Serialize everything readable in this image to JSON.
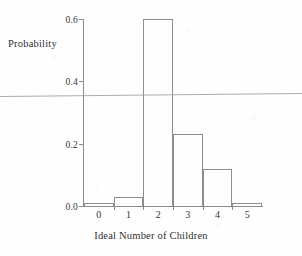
{
  "chart_data": {
    "type": "bar",
    "title": "",
    "xlabel": "Ideal Number of Children",
    "ylabel": "Probability",
    "categories": [
      "0",
      "1",
      "2",
      "3",
      "4",
      "5"
    ],
    "values": [
      0.01,
      0.03,
      0.6,
      0.23,
      0.12,
      0.01
    ],
    "ylim": [
      0.0,
      0.6
    ],
    "yticks": [
      "0.0",
      "0.2",
      "0.4",
      "0.6"
    ],
    "ytick_values": [
      0.0,
      0.2,
      0.4,
      0.6
    ],
    "xticks": [
      "0",
      "1",
      "2",
      "3",
      "4",
      "5"
    ],
    "grid": false,
    "legend": null,
    "series": [
      {
        "name": "Probability",
        "values": [
          0.01,
          0.03,
          0.6,
          0.23,
          0.12,
          0.01
        ]
      }
    ],
    "bar_style": "outlined-histogram",
    "colors": {
      "bar_outline": "#8d8d8d",
      "bar_fill": "transparent",
      "axis": "#8a8a8a",
      "text": "#2f2f2f",
      "background": "#fefefe"
    }
  },
  "artifacts": {
    "scan_line_label": "scan-artifact-line"
  }
}
